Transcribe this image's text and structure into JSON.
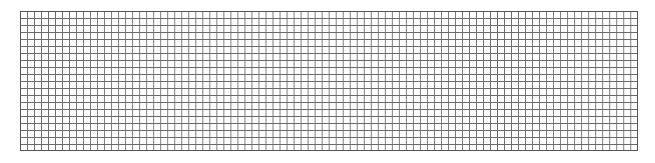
{
  "grid": {
    "columns": 88,
    "rows": 20,
    "cell_size_px": 7,
    "line_color": "#6a6a6a",
    "background_color": "#ffffff"
  }
}
